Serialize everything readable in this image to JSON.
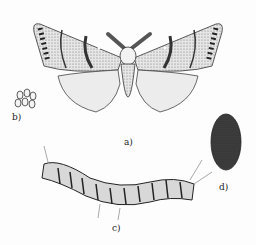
{
  "figure": {
    "labels": {
      "adult": "a)",
      "eggs": "b)",
      "larva": "c)",
      "cocoon": "d)"
    },
    "colors": {
      "ink": "#2a2a2a",
      "paper": "#fdfdfd",
      "shade": "#8a8a8a"
    }
  }
}
